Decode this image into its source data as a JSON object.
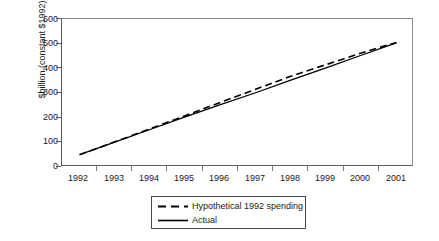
{
  "chart_data": {
    "type": "line",
    "title": "",
    "xlabel": "",
    "ylabel": "$billion (constant $1992)",
    "categories": [
      "1992",
      "1993",
      "1994",
      "1995",
      "1996",
      "1997",
      "1998",
      "1999",
      "2000",
      "2001"
    ],
    "ylim": [
      0,
      600
    ],
    "yticks": [
      0,
      100,
      200,
      300,
      400,
      500,
      600
    ],
    "ytick_labels": [
      "0",
      "100",
      "200",
      "300",
      "400",
      "500",
      "600"
    ],
    "grid": false,
    "legend_position": "bottom-center",
    "series": [
      {
        "name": "Hypothetical 1992 spending",
        "style": "dashed",
        "color": "#000000",
        "values": [
          50,
          102,
          155,
          208,
          262,
          315,
          368,
          415,
          462,
          505
        ]
      },
      {
        "name": "Actual",
        "style": "solid",
        "color": "#000000",
        "values": [
          50,
          101,
          152,
          203,
          253,
          301,
          352,
          402,
          453,
          503
        ]
      }
    ]
  },
  "axes": {
    "y_title": "$billion (constant $1992)",
    "y_tick_labels": [
      "600",
      "500",
      "400",
      "300",
      "200",
      "100",
      "0"
    ],
    "x_tick_labels": [
      "1992",
      "1993",
      "1994",
      "1995",
      "1996",
      "1997",
      "1998",
      "1999",
      "2000",
      "2001"
    ]
  },
  "legend": {
    "items": [
      {
        "label": "Hypothetical 1992 spending",
        "style": "dashed"
      },
      {
        "label": "Actual",
        "style": "solid"
      }
    ]
  }
}
